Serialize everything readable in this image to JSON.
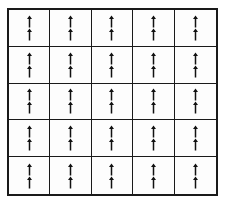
{
  "figure": {
    "type": "grid-of-symbols",
    "title": "",
    "caption": "",
    "background_color": "#ffffff",
    "cell_background_color": "#fdfdfd",
    "line_color": "#1a1a1a",
    "glyph_color": "#111111",
    "outer_border_width_px": 2,
    "inner_line_width_px": 1
  },
  "grid": {
    "rows": 5,
    "columns": 5,
    "total_cells": 25,
    "glyphs_per_cell": 2,
    "total_glyphs": 50,
    "glyph_icon_name": "up-arrow-icon",
    "glyph_symbol": "↑",
    "glyph_orientation": "up",
    "glyph_arrangement": "vertical-pair"
  },
  "cells": [
    {
      "row": 1,
      "col": 1,
      "glyphs": [
        "↑",
        "↑"
      ]
    },
    {
      "row": 1,
      "col": 2,
      "glyphs": [
        "↑",
        "↑"
      ]
    },
    {
      "row": 1,
      "col": 3,
      "glyphs": [
        "↑",
        "↑"
      ]
    },
    {
      "row": 1,
      "col": 4,
      "glyphs": [
        "↑",
        "↑"
      ]
    },
    {
      "row": 1,
      "col": 5,
      "glyphs": [
        "↑",
        "↑"
      ]
    },
    {
      "row": 2,
      "col": 1,
      "glyphs": [
        "↑",
        "↑"
      ]
    },
    {
      "row": 2,
      "col": 2,
      "glyphs": [
        "↑",
        "↑"
      ]
    },
    {
      "row": 2,
      "col": 3,
      "glyphs": [
        "↑",
        "↑"
      ]
    },
    {
      "row": 2,
      "col": 4,
      "glyphs": [
        "↑",
        "↑"
      ]
    },
    {
      "row": 2,
      "col": 5,
      "glyphs": [
        "↑",
        "↑"
      ]
    },
    {
      "row": 3,
      "col": 1,
      "glyphs": [
        "↑",
        "↑"
      ]
    },
    {
      "row": 3,
      "col": 2,
      "glyphs": [
        "↑",
        "↑"
      ]
    },
    {
      "row": 3,
      "col": 3,
      "glyphs": [
        "↑",
        "↑"
      ]
    },
    {
      "row": 3,
      "col": 4,
      "glyphs": [
        "↑",
        "↑"
      ]
    },
    {
      "row": 3,
      "col": 5,
      "glyphs": [
        "↑",
        "↑"
      ]
    },
    {
      "row": 4,
      "col": 1,
      "glyphs": [
        "↑",
        "↑"
      ]
    },
    {
      "row": 4,
      "col": 2,
      "glyphs": [
        "↑",
        "↑"
      ]
    },
    {
      "row": 4,
      "col": 3,
      "glyphs": [
        "↑",
        "↑"
      ]
    },
    {
      "row": 4,
      "col": 4,
      "glyphs": [
        "↑",
        "↑"
      ]
    },
    {
      "row": 4,
      "col": 5,
      "glyphs": [
        "↑",
        "↑"
      ]
    },
    {
      "row": 5,
      "col": 1,
      "glyphs": [
        "↑",
        "↑"
      ]
    },
    {
      "row": 5,
      "col": 2,
      "glyphs": [
        "↑",
        "↑"
      ]
    },
    {
      "row": 5,
      "col": 3,
      "glyphs": [
        "↑",
        "↑"
      ]
    },
    {
      "row": 5,
      "col": 4,
      "glyphs": [
        "↑",
        "↑"
      ]
    },
    {
      "row": 5,
      "col": 5,
      "glyphs": [
        "↑",
        "↑"
      ]
    }
  ]
}
